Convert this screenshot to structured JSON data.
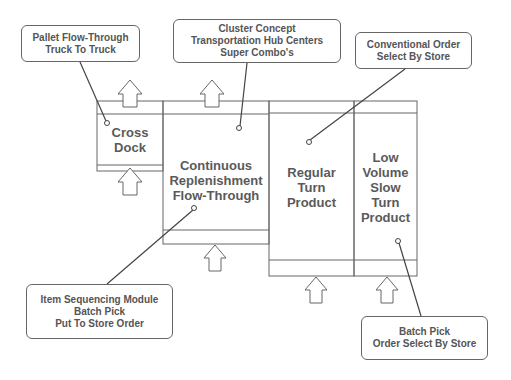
{
  "diagram": {
    "colors": {
      "line": "#666666",
      "text": "#555555",
      "background": "#ffffff"
    },
    "zones": [
      {
        "id": "cross-dock",
        "lines": [
          "Cross",
          "Dock"
        ]
      },
      {
        "id": "continuous",
        "lines": [
          "Continuous",
          "Replenishment",
          "Flow-Through"
        ]
      },
      {
        "id": "regular",
        "lines": [
          "Regular",
          "Turn",
          "Product"
        ]
      },
      {
        "id": "low-volume",
        "lines": [
          "Low",
          "Volume",
          "Slow",
          "Turn",
          "Product"
        ]
      }
    ],
    "callouts": [
      {
        "id": "pallet",
        "lines": [
          "Pallet Flow-Through",
          "Truck To Truck"
        ]
      },
      {
        "id": "cluster",
        "lines": [
          "Cluster Concept",
          "Transportation Hub Centers",
          "Super Combo's"
        ]
      },
      {
        "id": "conventional",
        "lines": [
          "Conventional Order",
          "Select By Store"
        ]
      },
      {
        "id": "item-seq",
        "lines": [
          "Item Sequencing Module",
          "Batch Pick",
          "Put To Store Order"
        ]
      },
      {
        "id": "batch-pick",
        "lines": [
          "Batch Pick",
          "Order Select By Store"
        ]
      }
    ],
    "arrow_icons": [
      "up-arrow-icon"
    ]
  }
}
